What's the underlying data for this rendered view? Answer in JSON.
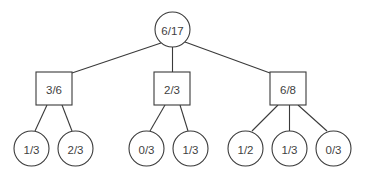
{
  "diagram": {
    "type": "tree",
    "title": "",
    "canvas": {
      "width": 370,
      "height": 181,
      "background": "#ffffff"
    },
    "style": {
      "stroke_color": "#3a3a3a",
      "text_color": "#3f3f3f",
      "node_fill": "#ffffff",
      "stroke_width": 1.1
    },
    "nodes": {
      "root": {
        "label": "6/17",
        "shape": "circle",
        "cx": 172.5,
        "cy": 29.5,
        "r": 17.5
      },
      "internal": [
        {
          "id": "left",
          "label": "3/6",
          "shape": "square",
          "x": 36,
          "y": 72,
          "w": 36,
          "h": 33
        },
        {
          "id": "middle",
          "label": "2/3",
          "shape": "square",
          "x": 154,
          "y": 72,
          "w": 36,
          "h": 33
        },
        {
          "id": "right",
          "label": "6/8",
          "shape": "square",
          "x": 270,
          "y": 72,
          "w": 36,
          "h": 33
        }
      ],
      "leaves": [
        {
          "id": "leaf1",
          "label": "1/3",
          "shape": "circle",
          "cx": 31.5,
          "cy": 148.5,
          "r": 17.5,
          "parent": "left"
        },
        {
          "id": "leaf2",
          "label": "2/3",
          "shape": "circle",
          "cx": 75.5,
          "cy": 148.5,
          "r": 17.5,
          "parent": "left"
        },
        {
          "id": "leaf3",
          "label": "0/3",
          "shape": "circle",
          "cx": 146.5,
          "cy": 148.5,
          "r": 17.5,
          "parent": "middle"
        },
        {
          "id": "leaf4",
          "label": "1/3",
          "shape": "circle",
          "cx": 190.5,
          "cy": 148.5,
          "r": 17.5,
          "parent": "middle"
        },
        {
          "id": "leaf5",
          "label": "1/2",
          "shape": "circle",
          "cx": 245.5,
          "cy": 148.5,
          "r": 17.5,
          "parent": "right"
        },
        {
          "id": "leaf6",
          "label": "1/3",
          "shape": "circle",
          "cx": 289.5,
          "cy": 148.5,
          "r": 17.5,
          "parent": "right"
        },
        {
          "id": "leaf7",
          "label": "0/3",
          "shape": "circle",
          "cx": 333.5,
          "cy": 148.5,
          "r": 17.5,
          "parent": "right"
        }
      ]
    },
    "edges": [
      {
        "from": "root",
        "to": "left",
        "x1": 161,
        "y1": 43,
        "x2": 72,
        "y2": 73
      },
      {
        "from": "root",
        "to": "middle",
        "x1": 172.5,
        "y1": 47,
        "x2": 172.5,
        "y2": 72
      },
      {
        "from": "root",
        "to": "right",
        "x1": 185,
        "y1": 42,
        "x2": 270,
        "y2": 73
      },
      {
        "from": "left",
        "to": "leaf1",
        "x1": 47,
        "y1": 105,
        "x2": 35,
        "y2": 131
      },
      {
        "from": "left",
        "to": "leaf2",
        "x1": 62,
        "y1": 105,
        "x2": 72,
        "y2": 131
      },
      {
        "from": "middle",
        "to": "leaf3",
        "x1": 165,
        "y1": 105,
        "x2": 150,
        "y2": 131
      },
      {
        "from": "middle",
        "to": "leaf4",
        "x1": 180,
        "y1": 105,
        "x2": 188,
        "y2": 131
      },
      {
        "from": "right",
        "to": "leaf5",
        "x1": 278,
        "y1": 105,
        "x2": 252,
        "y2": 131
      },
      {
        "from": "right",
        "to": "leaf6",
        "x1": 289.5,
        "y1": 105,
        "x2": 289.5,
        "y2": 131
      },
      {
        "from": "right",
        "to": "leaf7",
        "x1": 298,
        "y1": 105,
        "x2": 327,
        "y2": 131
      }
    ]
  }
}
